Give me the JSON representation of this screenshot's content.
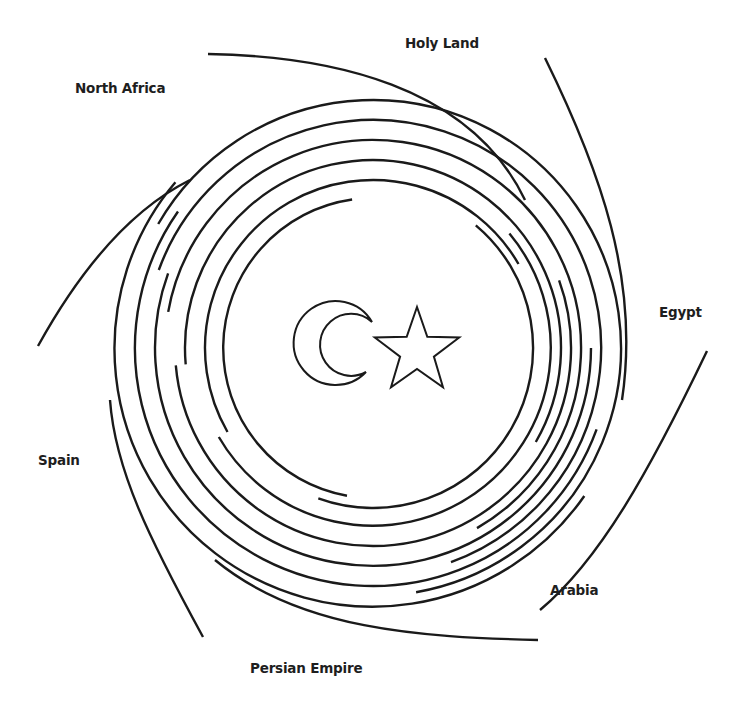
{
  "labels": {
    "north_africa": "North Africa",
    "holy_land": "Holy Land",
    "egypt": "Egypt",
    "spain": "Spain",
    "persian_empire": "Persian Empire",
    "arabia": "Arabia"
  },
  "label_positions": {
    "north_africa": [
      75,
      80
    ],
    "holy_land": [
      405,
      35
    ],
    "egypt": [
      659,
      304
    ],
    "spain": [
      38,
      452
    ],
    "persian_empire": [
      250,
      660
    ],
    "arabia": [
      550,
      582
    ]
  },
  "emblem": {
    "crescent": "crescent-moon",
    "star": "five-point-star",
    "stroke_color": "#1a1a1a",
    "fill_color": "#ffffff"
  },
  "spiral": {
    "center": [
      373,
      348
    ],
    "arm_count": 6,
    "inner_radius": 150,
    "ring_spacing": 8.5,
    "stroke_color": "#1a1a1a"
  }
}
